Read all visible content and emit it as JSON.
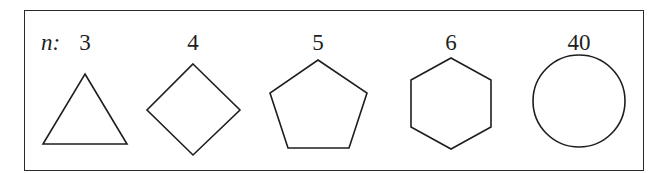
{
  "figure": {
    "variable_label": "n:",
    "shapes": [
      {
        "n_label": "3",
        "name": "triangle"
      },
      {
        "n_label": "4",
        "name": "square"
      },
      {
        "n_label": "5",
        "name": "pentagon"
      },
      {
        "n_label": "6",
        "name": "hexagon"
      },
      {
        "n_label": "40",
        "name": "circle"
      }
    ]
  },
  "colors": {
    "stroke": "#1e1e1e",
    "background": "#ffffff"
  }
}
